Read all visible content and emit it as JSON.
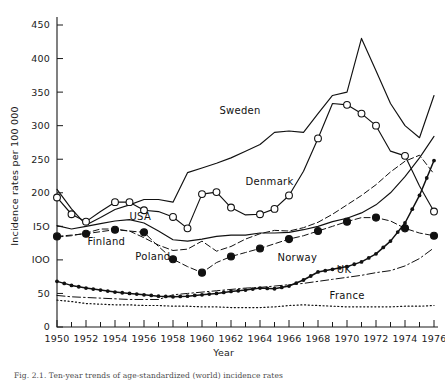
{
  "figure": {
    "caption": "Fig. 2.1. Ten-year trends of age-standardized (world) incidence rates"
  },
  "chart_data": {
    "type": "line",
    "title": "",
    "xlabel": "Year",
    "ylabel": "Incidence rates per 100 000",
    "xlim": [
      1950,
      1976
    ],
    "ylim": [
      0,
      460
    ],
    "yticks": [
      0,
      50,
      100,
      150,
      200,
      250,
      300,
      350,
      400,
      450
    ],
    "ytick_labels": [
      "0",
      "50",
      "IOO",
      "I5O",
      "200",
      "250",
      "300",
      "350",
      "400",
      "450"
    ],
    "xticks": [
      1950,
      1951,
      1952,
      1953,
      1954,
      1955,
      1956,
      1957,
      1958,
      1959,
      1960,
      1961,
      1962,
      1963,
      1964,
      1965,
      1966,
      1967,
      1968,
      1969,
      1970,
      1971,
      1972,
      1973,
      1974,
      1975,
      1976
    ],
    "xtick_labels": [
      "1950",
      "1952",
      "1954",
      "1956",
      "1958",
      "1960",
      "1962",
      "1964",
      "1966",
      "1968",
      "1970",
      "1972",
      "1974",
      "1976"
    ],
    "xtick_label_years": [
      1950,
      1952,
      1954,
      1956,
      1958,
      1960,
      1962,
      1964,
      1966,
      1968,
      1970,
      1972,
      1974,
      1976
    ],
    "grid": false,
    "legend": "inline-annotations",
    "x": [
      1950,
      1951,
      1952,
      1953,
      1954,
      1955,
      1956,
      1957,
      1958,
      1959,
      1960,
      1961,
      1962,
      1963,
      1964,
      1965,
      1966,
      1967,
      1968,
      1969,
      1970,
      1971,
      1972,
      1973,
      1974,
      1975,
      1976
    ],
    "series": [
      {
        "name": "Sweden",
        "label": "Sweden",
        "style": "solid",
        "marker": "none",
        "label_x": 1961.2,
        "label_y": 318,
        "values": [
          205,
          176,
          152,
          163,
          175,
          182,
          190,
          190,
          186,
          230,
          237,
          244,
          252,
          262,
          272,
          290,
          292,
          290,
          318,
          345,
          350,
          430,
          382,
          333,
          300,
          282,
          345
        ]
      },
      {
        "name": "Denmark",
        "label": "Denmark",
        "style": "solid",
        "marker": "open-circle",
        "label_x": 1963.0,
        "label_y": 212,
        "marker_years": [
          1950,
          1951,
          1952,
          1954,
          1955,
          1956,
          1958,
          1959,
          1960,
          1961,
          1962,
          1964,
          1965,
          1966,
          1968,
          1970,
          1971,
          1972,
          1974,
          1976
        ],
        "values": [
          193,
          168,
          157,
          172,
          186,
          186,
          174,
          172,
          164,
          147,
          198,
          201,
          178,
          167,
          168,
          176,
          196,
          232,
          281,
          333,
          331,
          318,
          300,
          262,
          255,
          210,
          172
        ]
      },
      {
        "name": "USA",
        "label": "USA",
        "style": "solid",
        "marker": "none",
        "label_x": 1955.0,
        "label_y": 160,
        "values": [
          151,
          146,
          150,
          154,
          158,
          160,
          155,
          143,
          130,
          128,
          131,
          135,
          137,
          137,
          140,
          140,
          141,
          145,
          150,
          157,
          162,
          170,
          182,
          200,
          224,
          252,
          284
        ]
      },
      {
        "name": "Finland",
        "label": "Finland",
        "style": "dashed",
        "marker": "none",
        "label_x": 1952.1,
        "label_y": 122,
        "values": [
          134,
          136,
          140,
          146,
          146,
          143,
          133,
          122,
          114,
          116,
          128,
          113,
          120,
          131,
          139,
          144,
          143,
          148,
          156,
          168,
          182,
          196,
          212,
          231,
          247,
          256,
          228
        ]
      },
      {
        "name": "Poland",
        "label": "Poland",
        "style": "dashed",
        "marker": "filled-circle",
        "label_x": 1955.4,
        "label_y": 100,
        "marker_years": [
          1950,
          1952,
          1954,
          1956,
          1958,
          1960,
          1962,
          1964,
          1966,
          1968,
          1970,
          1972,
          1974,
          1976
        ],
        "values": [
          135,
          137,
          139,
          142,
          145,
          143,
          141,
          120,
          101,
          90,
          81,
          96,
          105,
          111,
          117,
          124,
          131,
          136,
          143,
          150,
          157,
          163,
          163,
          158,
          147,
          140,
          136
        ]
      },
      {
        "name": "Norway",
        "label": "Norway",
        "style": "solid-dotted",
        "marker": "small-filled-circle",
        "label_x": 1965.2,
        "label_y": 98,
        "values": [
          68,
          62,
          58,
          55,
          52,
          50,
          48,
          46,
          45,
          46,
          48,
          50,
          53,
          55,
          58,
          57,
          61,
          70,
          82,
          86,
          90,
          97,
          109,
          128,
          155,
          196,
          248
        ]
      },
      {
        "name": "UK",
        "label": "UK",
        "style": "dash-dot",
        "marker": "none",
        "label_x": 1969.3,
        "label_y": 80,
        "values": [
          47,
          45,
          44,
          43,
          42,
          41,
          41,
          41,
          48,
          50,
          52,
          54,
          56,
          58,
          59,
          61,
          63,
          65,
          68,
          71,
          74,
          77,
          81,
          84,
          91,
          102,
          118
        ]
      },
      {
        "name": "France",
        "label": "France",
        "style": "dotted",
        "marker": "none",
        "label_x": 1968.8,
        "label_y": 42,
        "values": [
          40,
          38,
          35,
          34,
          33,
          33,
          32,
          32,
          31,
          31,
          30,
          30,
          29,
          29,
          29,
          30,
          32,
          33,
          32,
          31,
          30,
          30,
          30,
          30,
          31,
          31,
          32
        ]
      }
    ]
  },
  "colors": {
    "ink": "#111111",
    "background": "#ffffff"
  }
}
